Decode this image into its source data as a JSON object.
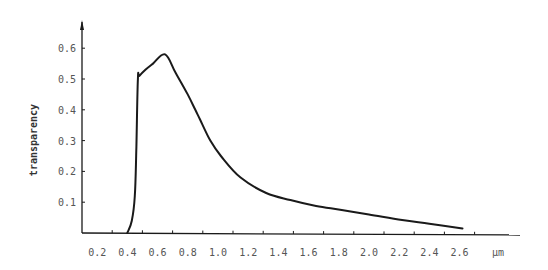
{
  "chart_data": {
    "type": "line",
    "title": "",
    "xlabel": "µm",
    "ylabel": "transparency",
    "xlim": [
      0,
      2.7
    ],
    "ylim": [
      0,
      0.65
    ],
    "grid": false,
    "legend": null,
    "x_ticks": [
      "0.2",
      "0.4",
      "0.6",
      "0.8",
      "1.0",
      "1.2",
      "1.4",
      "1.6",
      "1.8",
      "2.0",
      "2.2",
      "2.4",
      "2.6"
    ],
    "x_tick_values": [
      0.2,
      0.4,
      0.6,
      0.8,
      1.0,
      1.2,
      1.4,
      1.6,
      1.8,
      2.0,
      2.2,
      2.4,
      2.6
    ],
    "y_ticks": [
      "0.1",
      "0.2",
      "0.3",
      "0.4",
      "0.5",
      "0.6"
    ],
    "y_tick_values": [
      0.1,
      0.2,
      0.3,
      0.4,
      0.5,
      0.6
    ],
    "series": [
      {
        "name": "transparency",
        "color": "#1a1a1a",
        "x": [
          0.3,
          0.33,
          0.35,
          0.36,
          0.37,
          0.38,
          0.42,
          0.47,
          0.55,
          0.62,
          0.7,
          0.75,
          0.78,
          0.85,
          0.92,
          1.05,
          1.22,
          1.38,
          1.55,
          1.72,
          1.9,
          2.12,
          2.3,
          2.52
        ],
        "y": [
          0.0,
          0.04,
          0.12,
          0.28,
          0.5,
          0.51,
          0.53,
          0.55,
          0.58,
          0.52,
          0.45,
          0.4,
          0.37,
          0.3,
          0.25,
          0.18,
          0.13,
          0.107,
          0.088,
          0.075,
          0.06,
          0.042,
          0.03,
          0.015
        ]
      }
    ]
  }
}
